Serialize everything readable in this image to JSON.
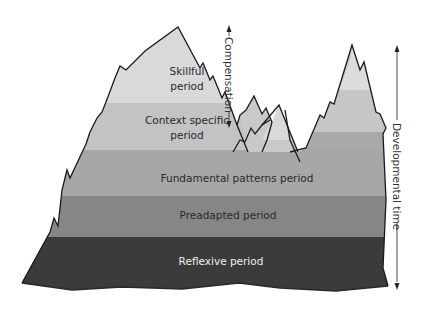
{
  "diagram": {
    "type": "mountain-model",
    "bands": [
      {
        "id": "skillful",
        "label_lines": [
          "Skillful",
          "period"
        ],
        "color": "#d9d9d9"
      },
      {
        "id": "context-specific",
        "label_lines": [
          "Context specific",
          "period"
        ],
        "color": "#c3c3c3"
      },
      {
        "id": "fundamental",
        "label_lines": [
          "Fundamental patterns period"
        ],
        "color": "#a7a7a7"
      },
      {
        "id": "preadapted",
        "label_lines": [
          "Preadapted period"
        ],
        "color": "#868686"
      },
      {
        "id": "reflexive",
        "label_lines": [
          "Reflexive period"
        ],
        "color": "#3b3b3b"
      }
    ],
    "arrows": {
      "compensation": {
        "label": "Compensation",
        "direction": "bidirectional-vertical"
      },
      "developmental_time": {
        "label": "Developmental time",
        "direction": "bidirectional-vertical"
      }
    },
    "outline_color": "#1a1a1a"
  }
}
